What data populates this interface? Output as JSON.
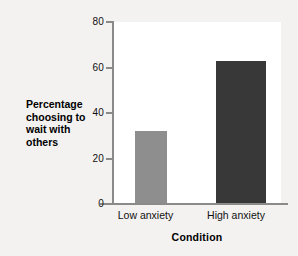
{
  "chart_data": {
    "type": "bar",
    "title": "",
    "categories": [
      "Low anxiety",
      "High anxiety"
    ],
    "values": [
      32,
      63
    ],
    "xlabel": "Condition",
    "ylabel": "Percentage choosing to wait with others",
    "ylim": [
      0,
      80
    ],
    "yticks": [
      0,
      20,
      40,
      60,
      80
    ],
    "ytick_labels": [
      "0",
      "20",
      "40",
      "60",
      "80"
    ],
    "grid": false,
    "legend": "none",
    "bar_colors": [
      "#8e8e8e",
      "#383838"
    ],
    "plot_background": "#ffffff",
    "figure_background": "#f3f2f0",
    "axis_color": "#8a8a8a"
  },
  "axis": {
    "y_title_lines": [
      "Percentage",
      "choosing to",
      "wait with",
      "others"
    ],
    "x_title": "Condition"
  }
}
